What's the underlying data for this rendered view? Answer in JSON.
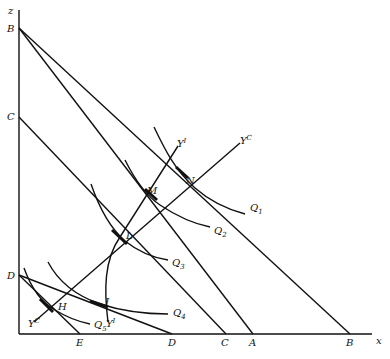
{
  "diagram": {
    "axes": {
      "x_label": "x",
      "y_label": "z"
    },
    "y_intercepts": [
      "B",
      "C",
      "D"
    ],
    "x_intercepts": [
      "E",
      "D",
      "C",
      "A",
      "B"
    ],
    "points": [
      "H",
      "J",
      "L",
      "M",
      "N"
    ],
    "isoquants": [
      "Q1",
      "Q2",
      "Q3",
      "Q4",
      "Q5"
    ],
    "expansion_paths": [
      "YC",
      "YI"
    ],
    "labels": {
      "z": "z",
      "x": "x",
      "B_y": "B",
      "C_y": "C",
      "D_y": "D",
      "E_x": "E",
      "D_x": "D",
      "C_x": "C",
      "A_x": "A",
      "B_x": "B",
      "N": "N",
      "M": "M",
      "L": "L",
      "J": "J",
      "H": "H",
      "Q1": "Q",
      "Q1s": "1",
      "Q2": "Q",
      "Q2s": "2",
      "Q3": "Q",
      "Q3s": "3",
      "Q4": "Q",
      "Q4s": "4",
      "Q5": "Q",
      "Q5s": "5",
      "YC_top": "Y",
      "YC_top_s": "C",
      "YI_top": "Y",
      "YI_top_s": "I",
      "YC_bot": "Y",
      "YC_bot_s": "C",
      "YI_bot": "Y",
      "YI_bot_s": "I"
    }
  }
}
